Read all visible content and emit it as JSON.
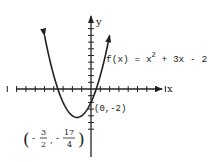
{
  "chart_data": {
    "type": "line",
    "title": "",
    "function": "f(x) = x^2 + 3x - 2",
    "xlabel": "x",
    "ylabel": "y",
    "xlim": [
      -9,
      10
    ],
    "ylim": [
      -7,
      9
    ],
    "grid": false,
    "x_ticks_step": 1,
    "y_ticks_step": 1,
    "series": [
      {
        "name": "f(x) = x^2 + 3x - 2",
        "points": [
          {
            "x": -5,
            "y": 8
          },
          {
            "x": -4.5,
            "y": 4.75
          },
          {
            "x": -4,
            "y": 2
          },
          {
            "x": -3.5,
            "y": -0.25
          },
          {
            "x": -3,
            "y": -2
          },
          {
            "x": -2.5,
            "y": -3.25
          },
          {
            "x": -2,
            "y": -4
          },
          {
            "x": -1.5,
            "y": -4.25
          },
          {
            "x": -1,
            "y": -4
          },
          {
            "x": -0.5,
            "y": -3.25
          },
          {
            "x": 0,
            "y": -2
          },
          {
            "x": 0.5,
            "y": -0.25
          },
          {
            "x": 1,
            "y": 2
          },
          {
            "x": 1.5,
            "y": 4.75
          },
          {
            "x": 2,
            "y": 8
          }
        ]
      }
    ],
    "annotations": [
      {
        "label": "(0,-2)",
        "x": 0,
        "y": -2,
        "description": "y-intercept"
      },
      {
        "label": "(-3/2, -17/4)",
        "x": -1.5,
        "y": -4.25,
        "description": "vertex"
      }
    ]
  },
  "labels": {
    "x_axis": "x",
    "y_axis": "y",
    "function_prefix": "f(x) = x",
    "function_exp": "2",
    "function_suffix": " + 3x - 2",
    "y_intercept": "(0,-2)",
    "vertex_open": "(",
    "vertex_minus1": "-",
    "vertex_num1": "3",
    "vertex_den1": "2",
    "vertex_comma": ",",
    "vertex_minus2": "-",
    "vertex_num2": "17",
    "vertex_den2": "4",
    "vertex_close": ")"
  }
}
